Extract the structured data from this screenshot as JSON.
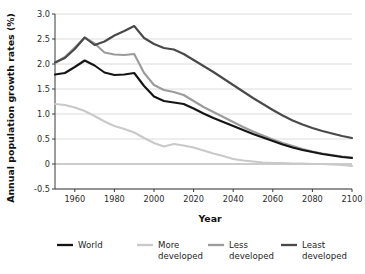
{
  "chart_data": {
    "type": "line",
    "title": "",
    "xlabel": "Year",
    "ylabel": "Annual population growth rates (%)",
    "xlim": [
      1950,
      2100
    ],
    "ylim": [
      -0.5,
      3.0
    ],
    "grid": true,
    "legend_position": "bottom",
    "x_ticks": [
      "1960",
      "1980",
      "2000",
      "2020",
      "2040",
      "2060",
      "2080",
      "2100"
    ],
    "x_tick_values": [
      1960,
      1980,
      2000,
      2020,
      2040,
      2060,
      2080,
      2100
    ],
    "y_ticks": [
      "-0.5",
      "0",
      "0.5",
      "1.0",
      "1.5",
      "2.0",
      "2.5",
      "3.0"
    ],
    "y_tick_values": [
      -0.5,
      0,
      0.5,
      1.0,
      1.5,
      2.0,
      2.5,
      3.0
    ],
    "x": [
      1950,
      1955,
      1960,
      1965,
      1970,
      1975,
      1980,
      1985,
      1990,
      1995,
      2000,
      2005,
      2010,
      2015,
      2020,
      2025,
      2030,
      2035,
      2040,
      2045,
      2050,
      2055,
      2060,
      2065,
      2070,
      2075,
      2080,
      2085,
      2090,
      2095,
      2100
    ],
    "series": [
      {
        "name": "World",
        "color": "#141414",
        "width": 2.1,
        "values": [
          1.79,
          1.82,
          1.94,
          2.07,
          1.97,
          1.83,
          1.78,
          1.79,
          1.82,
          1.56,
          1.35,
          1.26,
          1.23,
          1.2,
          1.11,
          1.01,
          0.92,
          0.84,
          0.76,
          0.68,
          0.6,
          0.53,
          0.46,
          0.39,
          0.33,
          0.28,
          0.24,
          0.2,
          0.17,
          0.14,
          0.12
        ]
      },
      {
        "name": "More developed",
        "color": "#c9c9c9",
        "width": 2.1,
        "values": [
          1.2,
          1.18,
          1.13,
          1.06,
          0.96,
          0.85,
          0.76,
          0.7,
          0.63,
          0.52,
          0.42,
          0.35,
          0.4,
          0.37,
          0.33,
          0.27,
          0.21,
          0.16,
          0.1,
          0.07,
          0.05,
          0.03,
          0.02,
          0.02,
          0.01,
          0.01,
          0.0,
          0.0,
          -0.01,
          -0.02,
          -0.04
        ]
      },
      {
        "name": "Less developed",
        "color": "#9b9b9b",
        "width": 2.1,
        "values": [
          2.02,
          2.14,
          2.33,
          2.53,
          2.41,
          2.23,
          2.19,
          2.18,
          2.2,
          1.82,
          1.58,
          1.48,
          1.44,
          1.38,
          1.26,
          1.14,
          1.04,
          0.94,
          0.84,
          0.74,
          0.65,
          0.57,
          0.49,
          0.42,
          0.36,
          0.3,
          0.25,
          0.21,
          0.18,
          0.15,
          0.13
        ]
      },
      {
        "name": "Least developed",
        "color": "#494949",
        "width": 2.1,
        "values": [
          2.03,
          2.12,
          2.3,
          2.53,
          2.38,
          2.45,
          2.57,
          2.66,
          2.76,
          2.52,
          2.4,
          2.32,
          2.29,
          2.2,
          2.08,
          1.96,
          1.84,
          1.71,
          1.58,
          1.45,
          1.32,
          1.2,
          1.08,
          0.97,
          0.87,
          0.79,
          0.72,
          0.66,
          0.61,
          0.56,
          0.52
        ]
      }
    ]
  },
  "legend": {
    "items": [
      {
        "label_line1": "World",
        "label_line2": "",
        "color": "#141414"
      },
      {
        "label_line1": "More",
        "label_line2": "developed",
        "color": "#c9c9c9"
      },
      {
        "label_line1": "Less",
        "label_line2": "developed",
        "color": "#9b9b9b"
      },
      {
        "label_line1": "Least",
        "label_line2": "developed",
        "color": "#494949"
      }
    ]
  }
}
